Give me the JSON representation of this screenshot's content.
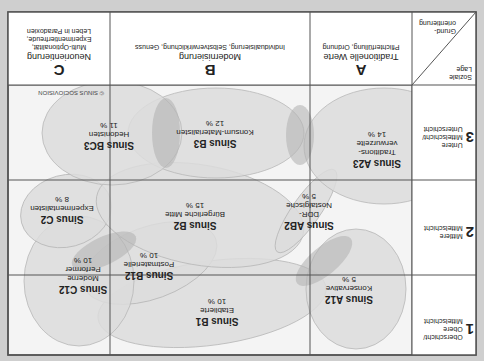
{
  "diagram": {
    "orientation_note": "Image displayed rotated 180°",
    "copyright": "© SINUS SOCIOVISION",
    "corner": {
      "top_label": "Soziale Lage",
      "bottom_label": "Grund-orientierung"
    },
    "rows": [
      {
        "num": "1",
        "label_l1": "Oberschicht/",
        "label_l2": "Obere",
        "label_l3": "Mittelschicht"
      },
      {
        "num": "2",
        "label_l1": "Mittlere",
        "label_l2": "Mittelschicht",
        "label_l3": ""
      },
      {
        "num": "3",
        "label_l1": "Untere",
        "label_l2": "Mittelschicht/",
        "label_l3": "Unterschicht"
      }
    ],
    "columns": [
      {
        "letter": "A",
        "title": "Traditionelle Werte",
        "desc_l1": "Pflichterfüllung, Ordnung",
        "desc_l2": "",
        "desc_l3": ""
      },
      {
        "letter": "B",
        "title": "Modernisierung",
        "desc_l1": "Individualisierung, Selbstverwirklichung, Genuss",
        "desc_l2": "",
        "desc_l3": ""
      },
      {
        "letter": "C",
        "title": "Neuorientierung",
        "desc_l1": "Multi-Optionalität,",
        "desc_l2": "Experimentierfreude,",
        "desc_l3": "Leben in Paradoxien"
      }
    ],
    "milieus": [
      {
        "id": "A12",
        "name": "Sinus A12",
        "desc": "Konservative",
        "pct": "5 %"
      },
      {
        "id": "A23",
        "name": "Sinus A23",
        "desc": "Traditions-verwurzelte",
        "pct": "14 %"
      },
      {
        "id": "AB2",
        "name": "Sinus AB2",
        "desc": "DDR-Nostalgische",
        "pct": "5 %"
      },
      {
        "id": "B1",
        "name": "Sinus B1",
        "desc": "Etablierte",
        "pct": "10 %"
      },
      {
        "id": "B12",
        "name": "Sinus B12",
        "desc": "Postmaterielle",
        "pct": "10 %"
      },
      {
        "id": "B2",
        "name": "Sinus B2",
        "desc": "Bürgerliche Mitte",
        "pct": "15 %"
      },
      {
        "id": "B3",
        "name": "Sinus B3",
        "desc": "Konsum-Materialisten",
        "pct": "12 %"
      },
      {
        "id": "C12",
        "name": "Sinus C12",
        "desc": "Moderne Performer",
        "pct": "10 %"
      },
      {
        "id": "C2",
        "name": "Sinus C2",
        "desc": "Experimentalisten",
        "pct": "8 %"
      },
      {
        "id": "BC3",
        "name": "Sinus BC3",
        "desc": "Hedonisten",
        "pct": "11 %"
      }
    ],
    "colors": {
      "background": "#cfcfcf",
      "cell": "#f4f4f4",
      "ellipse": "#dcdcdc",
      "overlap": "#b4b4b4",
      "grid": "#555555"
    }
  }
}
